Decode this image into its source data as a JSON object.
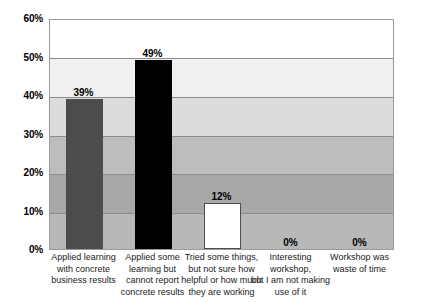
{
  "chart_data": {
    "type": "bar",
    "title": "",
    "subtitle": "",
    "xlabel": "",
    "ylabel": "",
    "ylim": [
      0,
      60
    ],
    "y_tick_labels": [
      "0%",
      "10%",
      "20%",
      "30%",
      "40%",
      "50%",
      "60%"
    ],
    "y_ticks": [
      0,
      10,
      20,
      30,
      40,
      50,
      60
    ],
    "grid": true,
    "legend": "none",
    "categories": [
      "Applied learning with concrete business results",
      "Applied some learning but cannot report concrete results",
      "Tried some things, but not sure how helpful or how much they are working",
      "Interesting workshop, but I am not making use of it",
      "Workshop was waste of time"
    ],
    "category_lines": [
      [
        "Applied learning",
        "with concrete",
        "business results"
      ],
      [
        "Applied some",
        "learning but",
        "cannot report",
        "concrete results"
      ],
      [
        "Tried some things,",
        "but not sure how",
        "helpful or how much",
        "they are working"
      ],
      [
        "Interesting workshop,",
        "but I am not making",
        "use of it"
      ],
      [
        "Workshop was",
        "waste of time"
      ]
    ],
    "values": [
      39,
      49,
      12,
      0,
      0
    ],
    "value_labels": [
      "39%",
      "49%",
      "12%",
      "0%",
      "0%"
    ],
    "bar_colors": [
      "#4c4c4c",
      "#000000",
      "#ffffff",
      "#b5b5b5",
      "#b5b5b5"
    ],
    "band_colors": [
      "#ffffff",
      "#f0f0f0",
      "#dcdcdc",
      "#bdbdbd",
      "#a8a8a8",
      "#b8b8b8"
    ],
    "band_ranges": [
      [
        50,
        60
      ],
      [
        40,
        50
      ],
      [
        30,
        40
      ],
      [
        20,
        30
      ],
      [
        10,
        20
      ],
      [
        0,
        10
      ]
    ],
    "plot_border_color": "#9a9a9a",
    "gridline_color": "#8c8c8c"
  }
}
